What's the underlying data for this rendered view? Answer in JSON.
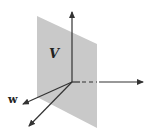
{
  "diagram": {
    "plane_label": "V",
    "vector_label": "w",
    "colors": {
      "plane": "#c9c9c9",
      "axes": "#333333",
      "background": "#ffffff"
    }
  }
}
